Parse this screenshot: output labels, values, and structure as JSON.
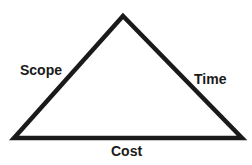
{
  "diagram": {
    "type": "project-management-triangle",
    "stroke_color": "#1a1a1a",
    "background": "#ffffff",
    "vertices": {
      "apex": [
        123,
        16
      ],
      "bottom_left": [
        14,
        138
      ],
      "bottom_right": [
        242,
        138
      ]
    },
    "labels": {
      "left_side": "Scope",
      "right_side": "Time",
      "bottom_side": "Cost"
    }
  }
}
